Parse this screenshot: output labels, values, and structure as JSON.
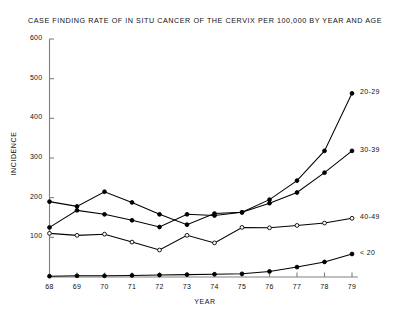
{
  "chart_data": {
    "type": "line",
    "title": "CASE FINDING RATE OF IN SITU CANCER OF THE CERVIX  PER 100,000 BY YEAR AND AGE",
    "xlabel": "YEAR",
    "ylabel": "INCIDENCE",
    "x": [
      68,
      69,
      70,
      71,
      72,
      73,
      74,
      75,
      76,
      77,
      78,
      79
    ],
    "xtick_labels": [
      "68",
      "69",
      "70",
      "71",
      "72",
      "73",
      "74",
      "75",
      "76",
      "77",
      "78",
      "79"
    ],
    "ytick_labels": [
      "100",
      "200",
      "300",
      "400",
      "500",
      "600"
    ],
    "ytick_values": [
      100,
      200,
      300,
      400,
      500,
      600
    ],
    "ylim": [
      0,
      600
    ],
    "xlim": [
      68,
      79
    ],
    "grid": false,
    "legend_position": "right-of-plot-line-end",
    "series": [
      {
        "name": "20-29",
        "label": "20-29",
        "marker": "filled-circle",
        "color": "#000000",
        "values": [
          190,
          178,
          215,
          188,
          158,
          132,
          160,
          163,
          195,
          243,
          318,
          463
        ]
      },
      {
        "name": "30-39",
        "label": "30-39",
        "marker": "filled-circle",
        "color": "#000000",
        "values": [
          125,
          168,
          158,
          143,
          126,
          158,
          155,
          163,
          186,
          213,
          263,
          318
        ]
      },
      {
        "name": "40-49",
        "label": "40-49",
        "marker": "open-circle",
        "color": "#000000",
        "values": [
          110,
          105,
          108,
          88,
          68,
          105,
          86,
          125,
          124,
          130,
          136,
          148
        ]
      },
      {
        "name": "< 20",
        "label": "< 20",
        "marker": "filled-circle",
        "color": "#000000",
        "values": [
          2,
          3,
          3,
          4,
          5,
          6,
          7,
          8,
          14,
          25,
          38,
          58
        ]
      }
    ]
  }
}
